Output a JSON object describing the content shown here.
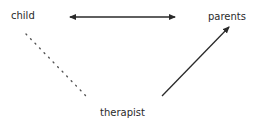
{
  "diagram": {
    "nodes": [
      {
        "id": "child",
        "label": "child"
      },
      {
        "id": "parents",
        "label": "parents"
      },
      {
        "id": "therapist",
        "label": "therapist"
      }
    ],
    "edges": [
      {
        "from": "child",
        "to": "parents",
        "style": "solid",
        "arrows": "both"
      },
      {
        "from": "child",
        "to": "therapist",
        "style": "dotted",
        "arrows": "none"
      },
      {
        "from": "therapist",
        "to": "parents",
        "style": "solid",
        "arrows": "end"
      }
    ],
    "colors": {
      "line": "#2a2a2a",
      "background": "#ffffff"
    }
  }
}
